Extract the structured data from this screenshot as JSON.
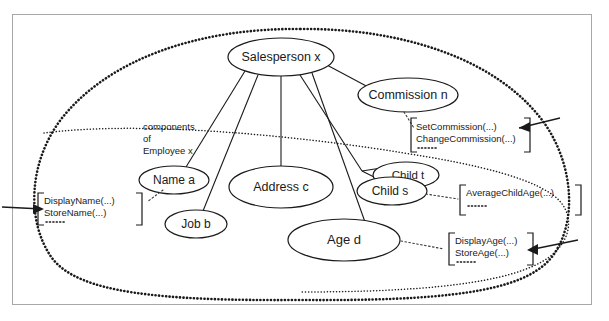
{
  "diagram": {
    "nodes": [
      {
        "id": "salesperson",
        "label": "Salesperson x",
        "cx": 281,
        "cy": 57,
        "rx": 53,
        "ry": 19,
        "fontsize": 12.5
      },
      {
        "id": "commission",
        "label": "Commission n",
        "cx": 408,
        "cy": 95,
        "rx": 50,
        "ry": 17,
        "fontsize": 12.5
      },
      {
        "id": "name",
        "label": "Name a",
        "cx": 174,
        "cy": 180,
        "rx": 35,
        "ry": 14,
        "fontsize": 12
      },
      {
        "id": "address",
        "label": "Address c",
        "cx": 281,
        "cy": 187,
        "rx": 52,
        "ry": 21,
        "fontsize": 12.5
      },
      {
        "id": "childt",
        "label": "Child t",
        "cx": 406,
        "cy": 175,
        "rx": 33,
        "ry": 13,
        "fontsize": 11.5
      },
      {
        "id": "childs",
        "label": "Child s",
        "cx": 392,
        "cy": 191,
        "rx": 35,
        "ry": 14,
        "fontsize": 12
      },
      {
        "id": "job",
        "label": "Job b",
        "cx": 196,
        "cy": 224,
        "rx": 31,
        "ry": 14,
        "fontsize": 12
      },
      {
        "id": "age",
        "label": "Age   d",
        "cx": 344,
        "cy": 240,
        "rx": 56,
        "ry": 21,
        "fontsize": 13
      }
    ],
    "annotations": {
      "components_label": {
        "lines": [
          "components",
          "of",
          "Employee x"
        ],
        "x": 143,
        "y": 126,
        "fontsize": 9.5,
        "lineheight": 12
      }
    },
    "method_boxes": [
      {
        "id": "commission-methods",
        "lines": [
          "SetCommission(...)",
          "ChangeCommission(...)"
        ],
        "ellipsis": "·····",
        "x": 412,
        "y": 122,
        "w": 118,
        "h": 32,
        "fontsize": 9.5,
        "source": "commission",
        "has_external_arrow": true,
        "arrow_side": "right"
      },
      {
        "id": "name-methods",
        "lines": [
          "DisplayName(...)",
          "StoreName(...)"
        ],
        "ellipsis": "·····",
        "x": 39,
        "y": 191,
        "w": 104,
        "h": 32,
        "fontsize": 9.5,
        "source": "name",
        "has_external_arrow": true,
        "arrow_side": "left"
      },
      {
        "id": "child-methods",
        "lines": [
          "AverageChildAge(...)"
        ],
        "ellipsis": "·····",
        "x": 458,
        "y": 184,
        "w": 122,
        "h": 30,
        "fontsize": 9.5,
        "source": "childs",
        "has_external_arrow": false,
        "arrow_side": ""
      },
      {
        "id": "age-methods",
        "lines": [
          "DisplayAge(...)",
          "StoreAge(...)"
        ],
        "ellipsis": "·····",
        "x": 444,
        "y": 232,
        "w": 92,
        "h": 32,
        "fontsize": 9.5,
        "source": "age",
        "has_external_arrow": true,
        "arrow_side": "right"
      }
    ],
    "colors": {
      "ink": "#1a1a1a",
      "frame": "#a8a8a8",
      "background": "#ffffff",
      "dotted": "#3a3a3a"
    }
  }
}
